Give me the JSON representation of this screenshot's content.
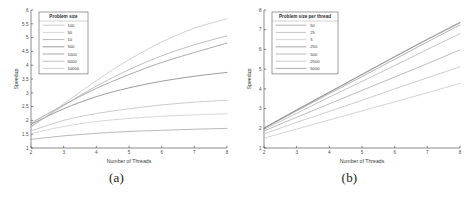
{
  "figure": {
    "panels": [
      {
        "caption": "(a)",
        "xlabel": "Number of Threads",
        "ylabel": "Speedup",
        "legend_title": "Problem size"
      },
      {
        "caption": "(b)",
        "xlabel": "Number of Threads",
        "ylabel": "Speedup",
        "legend_title": "Problem size per thread"
      }
    ]
  },
  "chart_data": [
    {
      "type": "line",
      "title": "",
      "panel": "(a)",
      "xlabel": "Number of Threads",
      "ylabel": "Speedup",
      "legend_title": "Problem size",
      "legend_position": "upper-left",
      "grid": false,
      "xlim": [
        2,
        8
      ],
      "ylim": [
        1,
        6
      ],
      "xticks": [
        2,
        3,
        4,
        5,
        6,
        7,
        8
      ],
      "yticks": [
        1,
        1.5,
        2,
        2.5,
        3,
        3.5,
        4,
        4.5,
        5,
        5.5,
        6
      ],
      "x": [
        2,
        3,
        4,
        5,
        6,
        7,
        8
      ],
      "series": [
        {
          "name": "100",
          "color": "#b9b9b9",
          "values": [
            1.62,
            2.0,
            2.25,
            2.42,
            2.56,
            2.66,
            2.73
          ]
        },
        {
          "name": "50",
          "color": "#c9c9c9",
          "values": [
            1.52,
            1.78,
            1.96,
            2.07,
            2.15,
            2.2,
            2.24
          ]
        },
        {
          "name": "10",
          "color": "#a0a0a0",
          "values": [
            1.31,
            1.44,
            1.53,
            1.6,
            1.64,
            1.68,
            1.71
          ]
        },
        {
          "name": "500",
          "color": "#7a7a7a",
          "values": [
            1.86,
            2.42,
            2.86,
            3.18,
            3.42,
            3.6,
            3.74
          ]
        },
        {
          "name": "1000",
          "color": "#8f8f8f",
          "values": [
            1.9,
            2.56,
            3.16,
            3.66,
            4.1,
            4.46,
            4.8
          ]
        },
        {
          "name": "5000",
          "color": "#a8a8a8",
          "values": [
            1.78,
            2.54,
            3.24,
            3.84,
            4.34,
            4.74,
            5.06
          ]
        },
        {
          "name": "10000",
          "color": "#c0c0c0",
          "values": [
            1.74,
            2.6,
            3.44,
            4.2,
            4.84,
            5.34,
            5.68
          ]
        }
      ]
    },
    {
      "type": "line",
      "title": "",
      "panel": "(b)",
      "xlabel": "Number of Threads",
      "ylabel": "Speedup",
      "legend_title": "Problem size per thread",
      "legend_position": "upper-left",
      "grid": false,
      "xlim": [
        2,
        8
      ],
      "ylim": [
        1,
        8
      ],
      "xticks": [
        2,
        3,
        4,
        5,
        6,
        7,
        8
      ],
      "yticks": [
        1,
        2,
        3,
        4,
        5,
        6,
        7,
        8
      ],
      "x": [
        2,
        3,
        4,
        5,
        6,
        7,
        8
      ],
      "series": [
        {
          "name": "50",
          "color": "#9a9a9a",
          "values": [
            2.0,
            2.88,
            3.76,
            4.62,
            5.5,
            6.38,
            7.24
          ]
        },
        {
          "name": "25",
          "color": "#b0b0b0",
          "values": [
            1.94,
            2.76,
            3.58,
            4.38,
            5.18,
            6.0,
            6.8
          ]
        },
        {
          "name": "5",
          "color": "#c6c6c6",
          "values": [
            1.5,
            1.96,
            2.42,
            2.88,
            3.34,
            3.8,
            4.28
          ]
        },
        {
          "name": "250",
          "color": "#8a8a8a",
          "values": [
            2.0,
            2.92,
            3.82,
            4.72,
            5.62,
            6.5,
            7.34
          ]
        },
        {
          "name": "500",
          "color": "#a4a4a4",
          "values": [
            1.86,
            2.56,
            3.24,
            3.92,
            4.6,
            5.28,
            5.98
          ]
        },
        {
          "name": "2500",
          "color": "#bcbcbc",
          "values": [
            1.72,
            2.3,
            2.86,
            3.42,
            4.0,
            4.56,
            5.12
          ]
        },
        {
          "name": "5000",
          "color": "#8f8f8f",
          "values": [
            2.02,
            2.94,
            3.84,
            4.74,
            5.64,
            6.52,
            7.38
          ]
        }
      ]
    }
  ]
}
